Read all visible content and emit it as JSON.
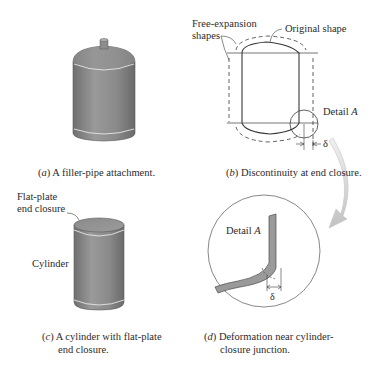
{
  "panels": {
    "a": {
      "caption_letter": "a",
      "caption_text": " A filler-pipe attachment."
    },
    "b": {
      "caption_letter": "b",
      "caption_text": " Discontinuity at end closure.",
      "labels": {
        "free_expansion_line1": "Free-expansion",
        "free_expansion_line2": "shapes",
        "original_shape": "Original shape",
        "detail_prefix": "Detail ",
        "detail_letter": "A",
        "delta": "δ"
      }
    },
    "c": {
      "caption_letter": "c",
      "caption_line1": " A cylinder with flat-plate",
      "caption_line2": "end closure.",
      "labels": {
        "flat_plate_line1": "Flat-plate",
        "flat_plate_line2": "end closure",
        "cylinder": "Cylinder"
      }
    },
    "d": {
      "caption_letter": "d",
      "caption_line1": " Deformation near cylinder-",
      "caption_line2": "closure junction.",
      "labels": {
        "detail_prefix": "Detail ",
        "detail_letter": "A",
        "delta": "δ"
      }
    }
  },
  "colors": {
    "vessel_fill": "#8e8e8e",
    "arrow_gray": "#cfcfcf",
    "line": "#3a3a3a"
  }
}
